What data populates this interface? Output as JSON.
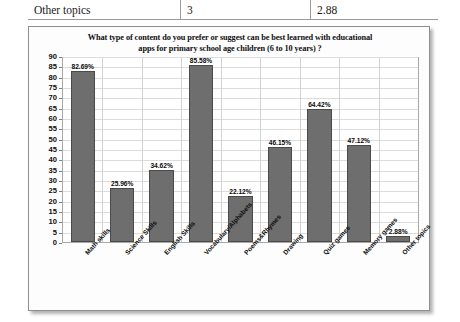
{
  "table_fragment": {
    "row": [
      "Other topics",
      "3",
      "2.88"
    ]
  },
  "chart_data": {
    "type": "bar",
    "title": "What type of content do you prefer or suggest can be best learned with educational apps for primary school age children (6 to 10 years) ?",
    "title_line1": "What type of content do you prefer or suggest can be best learned with educational",
    "title_line2": "apps for primary school age children (6 to 10 years) ?",
    "categories": [
      "Math skills",
      "Science Skills",
      "English Skills",
      "Vocabulary/Alphabets",
      "Poems&Rhymes",
      "Drawing",
      "Quiz games",
      "Memory games",
      "Other topics"
    ],
    "values": [
      82.69,
      25.96,
      34.62,
      85.58,
      22.12,
      46.15,
      64.42,
      47.12,
      2.88
    ],
    "data_labels": [
      "82.69%",
      "25.96%",
      "34.62%",
      "85.58%",
      "22.12%",
      "46.15%",
      "64.42%",
      "47.12%",
      "2.88%"
    ],
    "yticks": [
      0,
      5,
      10,
      15,
      20,
      25,
      30,
      35,
      40,
      45,
      50,
      55,
      60,
      65,
      70,
      75,
      80,
      85,
      90
    ],
    "ylim": [
      0,
      90
    ],
    "xlabel": "",
    "ylabel": "",
    "grid": true,
    "legend": false,
    "bar_color": "#6e6e6e",
    "bar_edge_color": "#4a4a4a",
    "plot_background": "#ffffff",
    "gridline_color": "#dcdcdc"
  }
}
